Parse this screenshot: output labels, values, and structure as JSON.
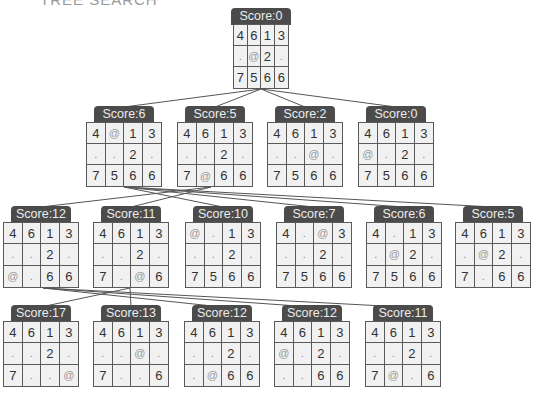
{
  "heading": "TREE SEARCH",
  "colors": {
    "label_bg": "#4b4b4b",
    "label_text": "#ececec",
    "cell_bg": "#f1f1f1",
    "border": "#5a5a5a",
    "edge": "#555555"
  },
  "nodes": [
    {
      "id": "n0",
      "label": "Score:0",
      "x": 233,
      "y": 24,
      "w": 56,
      "h": 65,
      "grid": [
        [
          "4",
          "6",
          "1",
          "3"
        ],
        [
          ".",
          "@",
          "2",
          "."
        ],
        [
          "7",
          "5",
          "6",
          "6"
        ]
      ]
    },
    {
      "id": "n1",
      "label": "Score:6",
      "x": 86,
      "y": 122,
      "w": 76,
      "h": 65,
      "grid": [
        [
          "4",
          "@",
          "1",
          "3"
        ],
        [
          ".",
          ".",
          "2",
          "."
        ],
        [
          "7",
          "5",
          "6",
          "6"
        ]
      ]
    },
    {
      "id": "n2",
      "label": "Score:5",
      "x": 177,
      "y": 122,
      "w": 76,
      "h": 65,
      "grid": [
        [
          "4",
          "6",
          "1",
          "3"
        ],
        [
          ".",
          ".",
          "2",
          "."
        ],
        [
          "7",
          "@",
          "6",
          "6"
        ]
      ]
    },
    {
      "id": "n3",
      "label": "Score:2",
      "x": 267,
      "y": 122,
      "w": 76,
      "h": 65,
      "grid": [
        [
          "4",
          "6",
          "1",
          "3"
        ],
        [
          ".",
          ".",
          "@",
          "."
        ],
        [
          "7",
          "5",
          "6",
          "6"
        ]
      ]
    },
    {
      "id": "n4",
      "label": "Score:0",
      "x": 358,
      "y": 122,
      "w": 76,
      "h": 65,
      "grid": [
        [
          "4",
          "6",
          "1",
          "3"
        ],
        [
          "@",
          ".",
          "2",
          "."
        ],
        [
          "7",
          "5",
          "6",
          "6"
        ]
      ]
    },
    {
      "id": "n5",
      "label": "Score:12",
      "x": 3,
      "y": 222,
      "w": 76,
      "h": 66,
      "grid": [
        [
          "4",
          "6",
          "1",
          "3"
        ],
        [
          ".",
          ".",
          "2",
          "."
        ],
        [
          "@",
          ".",
          "6",
          "6"
        ]
      ]
    },
    {
      "id": "n6",
      "label": "Score:11",
      "x": 93,
      "y": 222,
      "w": 76,
      "h": 66,
      "grid": [
        [
          "4",
          "6",
          "1",
          "3"
        ],
        [
          ".",
          ".",
          "2",
          "."
        ],
        [
          "7",
          ".",
          "@",
          "6"
        ]
      ]
    },
    {
      "id": "n7",
      "label": "Score:10",
      "x": 185,
      "y": 222,
      "w": 76,
      "h": 66,
      "grid": [
        [
          "@",
          ".",
          "1",
          "3"
        ],
        [
          ".",
          ".",
          "2",
          "."
        ],
        [
          "7",
          "5",
          "6",
          "6"
        ]
      ]
    },
    {
      "id": "n8",
      "label": "Score:7",
      "x": 276,
      "y": 222,
      "w": 76,
      "h": 66,
      "grid": [
        [
          "4",
          ".",
          "@",
          "3"
        ],
        [
          ".",
          ".",
          "2",
          "."
        ],
        [
          "7",
          "5",
          "6",
          "6"
        ]
      ]
    },
    {
      "id": "n9",
      "label": "Score:6",
      "x": 366,
      "y": 222,
      "w": 76,
      "h": 66,
      "grid": [
        [
          "4",
          ".",
          "1",
          "3"
        ],
        [
          ".",
          "@",
          "2",
          "."
        ],
        [
          "7",
          "5",
          "6",
          "6"
        ]
      ]
    },
    {
      "id": "n10",
      "label": "Score:5",
      "x": 455,
      "y": 222,
      "w": 76,
      "h": 66,
      "grid": [
        [
          "4",
          "6",
          "1",
          "3"
        ],
        [
          ".",
          "@",
          "2",
          "."
        ],
        [
          "7",
          ".",
          "6",
          "6"
        ]
      ]
    },
    {
      "id": "n11",
      "label": "Score:17",
      "x": 3,
      "y": 321,
      "w": 76,
      "h": 66,
      "grid": [
        [
          "4",
          "6",
          "1",
          "3"
        ],
        [
          ".",
          ".",
          "2",
          "."
        ],
        [
          "7",
          ".",
          ".",
          "@"
        ]
      ]
    },
    {
      "id": "n12",
      "label": "Score:13",
      "x": 93,
      "y": 321,
      "w": 76,
      "h": 66,
      "grid": [
        [
          "4",
          "6",
          "1",
          "3"
        ],
        [
          ".",
          ".",
          "@",
          "."
        ],
        [
          "7",
          ".",
          ".",
          "6"
        ]
      ]
    },
    {
      "id": "n13",
      "label": "Score:12",
      "x": 184,
      "y": 321,
      "w": 76,
      "h": 66,
      "grid": [
        [
          "4",
          "6",
          "1",
          "3"
        ],
        [
          ".",
          ".",
          "2",
          "."
        ],
        [
          ".",
          "@",
          "6",
          "6"
        ]
      ]
    },
    {
      "id": "n14",
      "label": "Score:12",
      "x": 274,
      "y": 321,
      "w": 76,
      "h": 66,
      "grid": [
        [
          "4",
          "6",
          "1",
          "3"
        ],
        [
          "@",
          ".",
          "2",
          "."
        ],
        [
          ".",
          ".",
          "6",
          "6"
        ]
      ]
    },
    {
      "id": "n15",
      "label": "Score:11",
      "x": 365,
      "y": 321,
      "w": 76,
      "h": 66,
      "grid": [
        [
          "4",
          "6",
          "1",
          "3"
        ],
        [
          ".",
          ".",
          "2",
          "."
        ],
        [
          "7",
          "@",
          ".",
          "6"
        ]
      ]
    }
  ],
  "edges": [
    {
      "from": [
        261,
        89
      ],
      "to": [
        124,
        107
      ]
    },
    {
      "from": [
        261,
        89
      ],
      "to": [
        215,
        107
      ]
    },
    {
      "from": [
        261,
        89
      ],
      "to": [
        305,
        107
      ]
    },
    {
      "from": [
        261,
        89
      ],
      "to": [
        396,
        107
      ]
    },
    {
      "from": [
        124,
        187
      ],
      "to": [
        223,
        207
      ]
    },
    {
      "from": [
        124,
        187
      ],
      "to": [
        314,
        207
      ]
    },
    {
      "from": [
        124,
        187
      ],
      "to": [
        404,
        207
      ]
    },
    {
      "from": [
        124,
        187
      ],
      "to": [
        493,
        207
      ]
    },
    {
      "from": [
        211,
        187
      ],
      "to": [
        41,
        207
      ]
    },
    {
      "from": [
        211,
        187
      ],
      "to": [
        131,
        207
      ]
    },
    {
      "from": [
        130,
        288
      ],
      "to": [
        41,
        307
      ]
    },
    {
      "from": [
        130,
        288
      ],
      "to": [
        131,
        307
      ]
    },
    {
      "from": [
        43,
        288
      ],
      "to": [
        222,
        307
      ]
    },
    {
      "from": [
        43,
        288
      ],
      "to": [
        312,
        307
      ]
    },
    {
      "from": [
        43,
        288
      ],
      "to": [
        403,
        307
      ]
    }
  ]
}
